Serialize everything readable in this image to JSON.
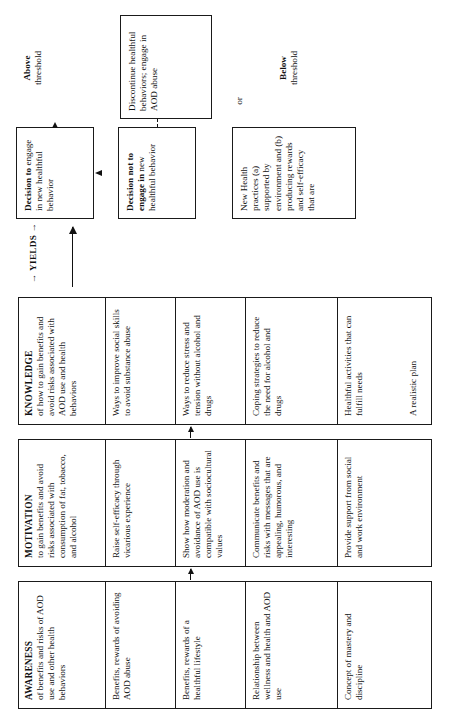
{
  "diagram": {
    "orientation": "rotated-90-ccw",
    "line_color": "#111111",
    "background": "#ffffff"
  },
  "categories": [
    {
      "id": "awareness",
      "head": "AWARENESS",
      "sub": "of benefits and risks of AOD use and other health behaviors",
      "items": [
        "Benefits, rewards of avoiding AOD abuse",
        "Benefits, rewards of a healthful lifestyle",
        "Relationship between wellness and health and AOD use",
        "Concept of mastery and discipline"
      ]
    },
    {
      "id": "motivation",
      "head": "MOTIVATION",
      "sub": "to gain benefits and avoid risks associated with consumption of fat, tobacco, and alcohol",
      "items": [
        "Raise self-efficacy through vicarious experience",
        "Show how moderation and avoidance of AOD use is compatible with sociocultural values",
        "Communicate benefits and risks with messages that are appealing, humorous, and interesting",
        "Provide support from social and work environment"
      ]
    },
    {
      "id": "knowledge",
      "head": "KNOWLEDGE",
      "sub": "of how to gain benefits and avoid risks associated with AOD use and health behaviors",
      "items": [
        "Ways to improve social skills to avoid substance abuse",
        "Ways to reduce stress and tension without alcohol and drugs",
        "Coping strategies to reduce the need for alcohol and drugs",
        "Healthful activities that can fulfill needs",
        "A realistic plan"
      ]
    }
  ],
  "flow": {
    "yields_label": "YIELDS",
    "decision_yes": {
      "bold": "Decision to",
      "rest": "engage in new healthful behavior"
    },
    "decision_no": {
      "bold": "Decision not to engage in",
      "rest": "new healthful behavior"
    },
    "practices": "New Health practices (a) supported by environment and (b) producing rewards and self-efficacy that are",
    "or_label": "or",
    "above": {
      "bold": "Above",
      "rest": "threshold"
    },
    "below": {
      "bold": "Below",
      "rest": "threshold"
    },
    "outcome_positive": {
      "bold1": "Continue",
      "rest1": "healthful behaviors",
      "bold2": "Prevent",
      "rest2": "AOD abuse"
    },
    "outcome_negative": "Discontinue healthful behaviors; engage in AOD abuse"
  }
}
